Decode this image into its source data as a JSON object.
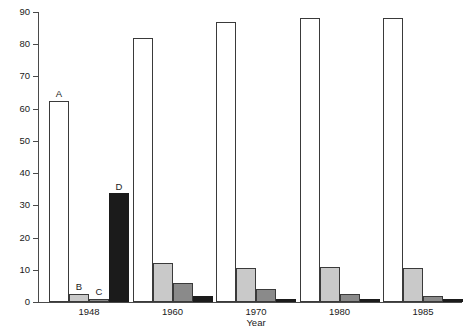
{
  "chart_data": {
    "type": "bar",
    "title": "",
    "xlabel": "Year",
    "ylabel": "",
    "categories": [
      "1948",
      "1960",
      "1970",
      "1980",
      "1985"
    ],
    "ylim": [
      0,
      90
    ],
    "yticks": [
      0,
      10,
      20,
      30,
      40,
      50,
      60,
      70,
      80,
      90
    ],
    "grid": false,
    "legend": "none",
    "series": [
      {
        "name": "A",
        "color": "#ffffff",
        "values": [
          62.5,
          82,
          87,
          88,
          88
        ]
      },
      {
        "name": "B",
        "color": "#c9c9c9",
        "values": [
          2.5,
          12,
          10.5,
          11,
          10.5
        ]
      },
      {
        "name": "C",
        "color": "#8a8a8a",
        "values": [
          1,
          6,
          4,
          2.5,
          2
        ]
      },
      {
        "name": "D",
        "color": "#1b1b1b",
        "values": [
          33.8,
          2,
          1,
          1,
          1
        ]
      }
    ],
    "annotations": [
      {
        "text": "A",
        "group": "1948",
        "series": "A"
      },
      {
        "text": "B",
        "group": "1948",
        "series": "B"
      },
      {
        "text": "C",
        "group": "1948",
        "series": "C"
      },
      {
        "text": "D",
        "group": "1948",
        "series": "D"
      }
    ]
  },
  "axis": {
    "y_tick_labels": [
      "0",
      "10",
      "20",
      "30",
      "40",
      "50",
      "60",
      "70",
      "80",
      "90"
    ],
    "x_tick_labels": [
      "1948",
      "1960",
      "1970",
      "1980",
      "1985"
    ],
    "x_axis_title": "Year"
  }
}
